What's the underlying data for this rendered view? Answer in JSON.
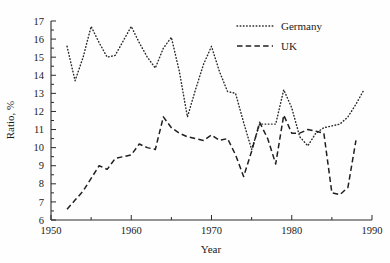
{
  "chart_data": {
    "type": "line",
    "title": "",
    "xlabel": "Year",
    "ylabel": "Ratio, %",
    "xlim": [
      1950,
      1990
    ],
    "ylim": [
      6,
      17
    ],
    "grid": false,
    "legend_position": "top-right",
    "xticks_major": [
      1950,
      1960,
      1970,
      1980,
      1990
    ],
    "xticks_major_labels": [
      "1950",
      "1960",
      "1970",
      "1980",
      "1990"
    ],
    "xticks_minor": [
      1955,
      1965,
      1975,
      1985
    ],
    "yticks": [
      6,
      7,
      8,
      9,
      10,
      11,
      12,
      13,
      14,
      15,
      16,
      17
    ],
    "ytick_labels": [
      "6",
      "7",
      "8",
      "9",
      "10",
      "11",
      "12",
      "13",
      "14",
      "15",
      "16",
      "17"
    ],
    "series": [
      {
        "name": "Germany",
        "style": "dotted",
        "x": [
          1952,
          1953,
          1954,
          1955,
          1956,
          1957,
          1958,
          1959,
          1960,
          1961,
          1962,
          1963,
          1964,
          1965,
          1966,
          1967,
          1968,
          1969,
          1970,
          1971,
          1972,
          1973,
          1974,
          1975,
          1976,
          1977,
          1978,
          1979,
          1980,
          1981,
          1982,
          1983,
          1984,
          1985,
          1986,
          1987,
          1988,
          1989
        ],
        "values": [
          15.6,
          13.7,
          15.0,
          16.7,
          15.8,
          15.0,
          15.1,
          15.9,
          16.7,
          15.8,
          15.0,
          14.4,
          15.5,
          16.1,
          14.2,
          11.7,
          13.2,
          14.6,
          15.6,
          14.2,
          13.1,
          13.0,
          11.4,
          9.9,
          11.3,
          11.3,
          11.3,
          13.2,
          12.2,
          10.6,
          10.1,
          10.8,
          11.1,
          11.2,
          11.3,
          11.7,
          12.4,
          13.2
        ]
      },
      {
        "name": "UK",
        "style": "dashed",
        "x": [
          1952,
          1953,
          1954,
          1955,
          1956,
          1957,
          1958,
          1959,
          1960,
          1961,
          1962,
          1963,
          1964,
          1965,
          1966,
          1967,
          1968,
          1969,
          1970,
          1971,
          1972,
          1973,
          1974,
          1975,
          1976,
          1977,
          1978,
          1979,
          1980,
          1981,
          1982,
          1983,
          1984,
          1985,
          1986,
          1987,
          1988
        ],
        "values": [
          6.6,
          7.1,
          7.6,
          8.3,
          9.0,
          8.8,
          9.4,
          9.5,
          9.6,
          10.2,
          10.0,
          9.9,
          11.7,
          11.1,
          10.8,
          10.6,
          10.5,
          10.4,
          10.7,
          10.4,
          10.5,
          9.6,
          8.4,
          9.8,
          11.4,
          10.5,
          9.1,
          11.8,
          10.8,
          10.8,
          11.0,
          10.9,
          10.8,
          7.5,
          7.4,
          7.8,
          10.4
        ],
        "values_detailed": [
          6.6,
          7.1,
          7.6,
          8.3,
          9.0,
          8.8,
          9.4,
          9.5,
          9.6,
          10.2,
          10.0,
          9.9,
          12.35,
          11.1,
          10.8,
          10.6,
          10.5,
          10.4,
          10.7,
          10.4,
          8.45,
          11.4,
          11.15,
          9.1,
          11.1,
          10.8,
          10.8,
          11.0,
          7.45,
          8.2,
          8.6,
          8.5,
          10.4
        ]
      }
    ]
  },
  "legend": {
    "entries": [
      {
        "label": "Germany",
        "style": "dotted"
      },
      {
        "label": "UK",
        "style": "dashed"
      }
    ]
  }
}
